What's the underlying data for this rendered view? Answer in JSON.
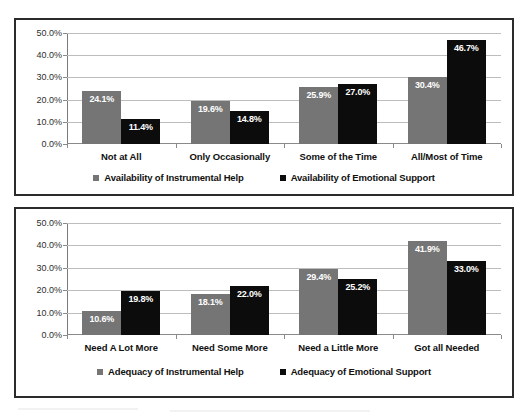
{
  "page": {
    "top_cut_text": "",
    "background": "#ffffff"
  },
  "colors": {
    "series_a": "#757575",
    "series_b": "#0c0c0c",
    "frame": "#2b2b2b",
    "gridline": "#bdbdbd",
    "axis": "#8a8a8a",
    "label_text": "#111111",
    "bar_label_text": "#ffffff"
  },
  "charts": [
    {
      "id": "availability-chart",
      "title": "",
      "yticks": [
        "0.0%",
        "10.0%",
        "20.0%",
        "30.0%",
        "40.0%",
        "50.0%"
      ],
      "categories": [
        "Not at All",
        "Only Occasionally",
        "Some of the Time",
        "All/Most of Time"
      ],
      "legend": [
        {
          "label": "Availability of Instrumental Help",
          "color": "#757575"
        },
        {
          "label": "Availability of Emotional Support",
          "color": "#0c0c0c"
        }
      ],
      "series": [
        {
          "name": "Availability of Instrumental Help",
          "values": [
            24.1,
            19.6,
            25.9,
            30.4
          ],
          "labels": [
            "24.1%",
            "19.6%",
            "25.9%",
            "30.4%"
          ]
        },
        {
          "name": "Availability of Emotional Support",
          "values": [
            11.4,
            14.8,
            27.0,
            46.7
          ],
          "labels": [
            "11.4%",
            "14.8%",
            "27.0%",
            "46.7%"
          ]
        }
      ]
    },
    {
      "id": "adequacy-chart",
      "title": "",
      "yticks": [
        "0.0%",
        "10.0%",
        "20.0%",
        "30.0%",
        "40.0%",
        "50.0%"
      ],
      "categories": [
        "Need A Lot More",
        "Need Some More",
        "Need a Little More",
        "Got all Needed"
      ],
      "legend": [
        {
          "label": "Adequacy of Instrumental Help",
          "color": "#757575"
        },
        {
          "label": "Adequacy of Emotional Support",
          "color": "#0c0c0c"
        }
      ],
      "series": [
        {
          "name": "Adequacy of Instrumental Help",
          "values": [
            10.6,
            18.1,
            29.4,
            41.9
          ],
          "labels": [
            "10.6%",
            "18.1%",
            "29.4%",
            "41.9%"
          ]
        },
        {
          "name": "Adequacy of Emotional Support",
          "values": [
            19.8,
            22.0,
            25.2,
            33.0
          ],
          "labels": [
            "19.8%",
            "22.0%",
            "25.2%",
            "33.0%"
          ]
        }
      ]
    }
  ],
  "chart_data": [
    {
      "type": "bar",
      "title": "Availability of Instrumental Help and Emotional Support",
      "xlabel": "",
      "ylabel": "",
      "ylim": [
        0,
        50
      ],
      "ytick_values": [
        0,
        10,
        20,
        30,
        40,
        50
      ],
      "ytick_labels": [
        "0.0%",
        "10.0%",
        "20.0%",
        "30.0%",
        "40.0%",
        "50.0%"
      ],
      "grid": true,
      "legend_position": "bottom",
      "categories": [
        "Not at All",
        "Only Occasionally",
        "Some of the Time",
        "All/Most of Time"
      ],
      "series": [
        {
          "name": "Availability of Instrumental Help",
          "color": "#757575",
          "values": [
            24.1,
            19.6,
            25.9,
            30.4
          ]
        },
        {
          "name": "Availability of Emotional Support",
          "color": "#0c0c0c",
          "values": [
            11.4,
            14.8,
            27.0,
            46.7
          ]
        }
      ]
    },
    {
      "type": "bar",
      "title": "Adequacy of Instrumental Help and Emotional Support",
      "xlabel": "",
      "ylabel": "",
      "ylim": [
        0,
        50
      ],
      "ytick_values": [
        0,
        10,
        20,
        30,
        40,
        50
      ],
      "ytick_labels": [
        "0.0%",
        "10.0%",
        "20.0%",
        "30.0%",
        "40.0%",
        "50.0%"
      ],
      "grid": true,
      "legend_position": "bottom",
      "categories": [
        "Need A Lot More",
        "Need Some More",
        "Need a Little More",
        "Got all Needed"
      ],
      "series": [
        {
          "name": "Adequacy of Instrumental Help",
          "color": "#757575",
          "values": [
            10.6,
            18.1,
            29.4,
            41.9
          ]
        },
        {
          "name": "Adequacy of Emotional Support",
          "color": "#0c0c0c",
          "values": [
            19.8,
            22.0,
            25.2,
            33.0
          ]
        }
      ]
    }
  ]
}
